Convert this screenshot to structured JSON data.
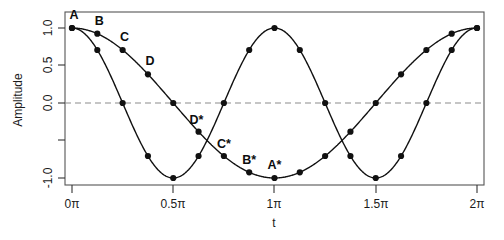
{
  "chart_data": {
    "type": "line",
    "title": "",
    "xlabel": "t",
    "ylabel": "Amplitude",
    "xlim": [
      0,
      2
    ],
    "ylim": [
      -1.0,
      1.0
    ],
    "grid": false,
    "legend": "none",
    "x_unit": "pi",
    "xticks": [
      0,
      0.5,
      1,
      1.5,
      2
    ],
    "xticklabels": [
      "0π",
      "0.5π",
      "1π",
      "1.5π",
      "2π"
    ],
    "yticks": [
      -1.0,
      -0.5,
      0.0,
      0.5,
      1.0
    ],
    "yticklabels": [
      "-1.0",
      "",
      "0.0",
      "0.5",
      "1.0"
    ],
    "zero_line": {
      "y": 0.0,
      "style": "dashed",
      "color": "#8c8c8c"
    },
    "marker": "filled-circle",
    "marker_color": "#111111",
    "line_color": "#111111",
    "x": [
      0,
      0.125,
      0.25,
      0.375,
      0.5,
      0.625,
      0.75,
      0.875,
      1.0,
      1.125,
      1.25,
      1.375,
      1.5,
      1.625,
      1.75,
      1.875,
      2.0
    ],
    "series": [
      {
        "name": "fast-cosine",
        "expression": "cos(2t)",
        "period": 1.0,
        "values": [
          1.0,
          0.707,
          0.0,
          -0.707,
          -1.0,
          -0.707,
          0.0,
          0.707,
          1.0,
          0.707,
          0.0,
          -0.707,
          -1.0,
          -0.707,
          0.0,
          0.707,
          1.0
        ]
      },
      {
        "name": "slow-cosine",
        "expression": "cos(t)",
        "period": 2.0,
        "values": [
          1.0,
          0.924,
          0.707,
          0.383,
          0.0,
          -0.383,
          -0.707,
          -0.924,
          -1.0,
          -0.924,
          -0.707,
          -0.383,
          0.0,
          0.383,
          0.707,
          0.924,
          1.0
        ]
      }
    ],
    "annotations": [
      {
        "label": "A",
        "x": 0.0,
        "y": 1.0,
        "series": "slow-cosine",
        "dx": 2,
        "dy": -9
      },
      {
        "label": "B",
        "x": 0.125,
        "y": 0.924,
        "series": "slow-cosine",
        "dx": 2,
        "dy": -9
      },
      {
        "label": "C",
        "x": 0.25,
        "y": 0.707,
        "series": "slow-cosine",
        "dx": 2,
        "dy": -9
      },
      {
        "label": "D",
        "x": 0.375,
        "y": 0.383,
        "series": "slow-cosine",
        "dx": 2,
        "dy": -9
      },
      {
        "label": "D*",
        "x": 0.625,
        "y": -0.383,
        "series": "slow-cosine",
        "dx": -2,
        "dy": -8
      },
      {
        "label": "C*",
        "x": 0.75,
        "y": -0.707,
        "series": "slow-cosine",
        "dx": 0,
        "dy": -8
      },
      {
        "label": "B*",
        "x": 0.875,
        "y": -0.924,
        "series": "slow-cosine",
        "dx": 0,
        "dy": -8
      },
      {
        "label": "A*",
        "x": 1.0,
        "y": -1.0,
        "series": "slow-cosine",
        "dx": 0,
        "dy": -9
      }
    ]
  }
}
